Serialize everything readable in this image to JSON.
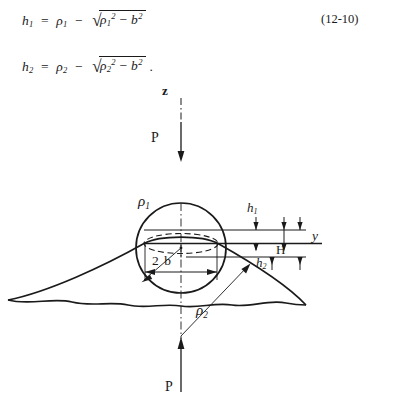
{
  "equations": {
    "eq1": {
      "lhs": "h",
      "lhs_sub": "1",
      "equals": "=",
      "rho": "ρ",
      "rho_sub": "1",
      "minus": "−",
      "radical": "√",
      "rad_rho": "ρ",
      "rad_rho_sub": "1",
      "rad_rho_sup": "2",
      "rad_minus": "−",
      "rad_b": "b",
      "rad_b_sup": "2",
      "trailing": ""
    },
    "eq2": {
      "lhs": "h",
      "lhs_sub": "2",
      "equals": "=",
      "rho": "ρ",
      "rho_sub": "2",
      "minus": "−",
      "radical": "√",
      "rad_rho": "ρ",
      "rad_rho_sub": "2",
      "rad_rho_sup": "2",
      "rad_minus": "−",
      "rad_b": "b",
      "rad_b_sup": "2",
      "trailing": "."
    },
    "number": "(12-10)"
  },
  "figure": {
    "labels": {
      "axis_z": "z",
      "axis_y": "y",
      "force_top": "P",
      "force_bottom": "P",
      "radius_upper": "ρ",
      "radius_upper_sub": "1",
      "radius_lower": "ρ",
      "radius_lower_sub": "2",
      "contact_width": "2 b",
      "height_upper": "h",
      "height_upper_sub": "1",
      "height_lower": "h",
      "height_lower_sub": "2",
      "total_height": "H"
    },
    "colors": {
      "stroke": "#1a1a1a",
      "background": "#ffffff"
    },
    "geometry": {
      "circle_center_x": 181,
      "circle_center_y": 203,
      "circle_radius": 45,
      "contact_half_width_px": 36,
      "centerline_x": 181
    }
  }
}
